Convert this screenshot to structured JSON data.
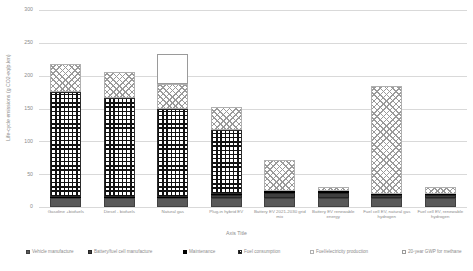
{
  "chart_data": {
    "type": "bar",
    "title": "",
    "xlabel": "Axis Title",
    "ylabel": "Life-cycle emissions (g CO2-eq/p.km)",
    "ylim": [
      0,
      300
    ],
    "ytick_labels": [
      "0",
      "50",
      "100",
      "150",
      "200",
      "250",
      "300"
    ],
    "yticks": [
      0,
      50,
      100,
      150,
      200,
      250,
      300
    ],
    "grid": true,
    "stacked": true,
    "legend_position": "bottom",
    "categories": [
      "Gasoline +biofuels",
      "Diesel - biofuels",
      "Natural gas",
      "Plug-in hybrid EV",
      "Battery EV 2021-2030 grid mix",
      "Battery EV renewable energy",
      "Fuel cell EV, natural gas hydrogen",
      "Fuel cell EV, renewable hydrogen"
    ],
    "series": [
      {
        "name": "Vehicle manufacture",
        "pattern": "solid-dark-grey",
        "values": [
          14,
          14,
          14,
          14,
          14,
          14,
          14,
          14
        ]
      },
      {
        "name": "Battery/fuel cell manufacture",
        "pattern": "solid-darker-grey",
        "values": [
          0,
          0,
          0,
          4,
          8,
          8,
          4,
          4
        ]
      },
      {
        "name": "Maintenance",
        "pattern": "solid-black",
        "values": [
          2,
          2,
          2,
          2,
          2,
          2,
          2,
          2
        ]
      },
      {
        "name": "Fuel consumption",
        "pattern": "dense-black-grid",
        "values": [
          159,
          150,
          133,
          97,
          0,
          0,
          0,
          0
        ]
      },
      {
        "name": "Fuel/electricity production",
        "pattern": "light-diagonal-hatch",
        "values": [
          43,
          39,
          39,
          35,
          48,
          7,
          165,
          10
        ]
      },
      {
        "name": "20-year GWP for methane",
        "pattern": "hollow-outline",
        "values": [
          0,
          0,
          45,
          0,
          0,
          0,
          0,
          0
        ]
      }
    ],
    "totals": [
      218,
      205,
      233,
      152,
      72,
      31,
      185,
      30
    ]
  },
  "legend": {
    "items": [
      {
        "label": "Vehicle manufacture"
      },
      {
        "label": "Battery/fuel cell manufacture"
      },
      {
        "label": "Maintenance"
      },
      {
        "label": "Fuel consumption"
      },
      {
        "label": "Fuel/electricity production"
      },
      {
        "label": "20-year GWP for methane"
      }
    ]
  }
}
